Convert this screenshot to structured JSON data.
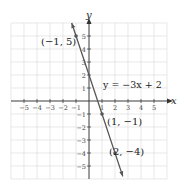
{
  "chart_data": {
    "type": "line",
    "title": "",
    "xlabel": "x",
    "ylabel": "y",
    "xlim": [
      -6,
      6
    ],
    "ylim": [
      -6,
      6
    ],
    "grid": true,
    "x_ticks": [
      -5,
      -4,
      -3,
      -2,
      -1,
      1,
      2,
      3,
      4,
      5
    ],
    "y_ticks": [
      -5,
      -4,
      -3,
      -2,
      -1,
      1,
      2,
      3,
      4,
      5
    ],
    "x_tick_labels": [
      "−5",
      "−4",
      "−3",
      "−2",
      "−1",
      "1",
      "2",
      "3",
      "4",
      "5"
    ],
    "y_tick_labels": [
      "−5",
      "−4",
      "−3",
      "−2",
      "−1",
      "1",
      "2",
      "3",
      "4",
      "5"
    ],
    "series": [
      {
        "name": "y = −3x + 2",
        "equation": "y = -3x + 2",
        "slope": -3,
        "intercept": 2,
        "x": [
          -1.33,
          2.6
        ],
        "y": [
          6,
          -5.8
        ]
      }
    ],
    "points": [
      {
        "x": -1,
        "y": 5,
        "label": "(−1, 5)"
      },
      {
        "x": 1,
        "y": -1,
        "label": "(1, −1)"
      },
      {
        "x": 2,
        "y": -4,
        "label": "(2, −4)"
      }
    ],
    "annotations": [
      {
        "text": "y = −3x + 2",
        "x": 1.4,
        "y": 2
      }
    ]
  },
  "labels": {
    "x_axis": "x",
    "y_axis": "y",
    "equation": "y = −3x + 2",
    "point_a": "(−1, 5)",
    "point_b": "(1, −1)",
    "point_c": "(2, −4)"
  },
  "colors": {
    "grid": "#d9d9d9",
    "axis": "#333333",
    "line": "#555555",
    "point": "#555555"
  }
}
